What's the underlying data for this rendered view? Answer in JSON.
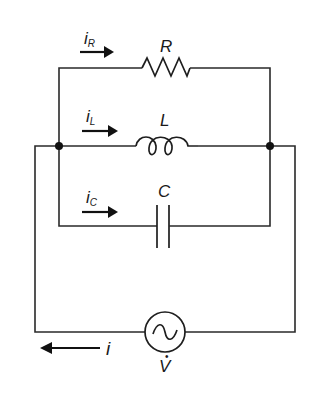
{
  "diagram": {
    "components": {
      "resistor": {
        "label": "R"
      },
      "inductor": {
        "label": "L"
      },
      "capacitor": {
        "label": "C"
      },
      "source": {
        "label": "V",
        "label_mark": "̇",
        "symbol": "~"
      }
    },
    "currents": {
      "i_R": {
        "main": "i",
        "sub": "R",
        "direction": "right"
      },
      "i_L": {
        "main": "i",
        "sub": "L",
        "direction": "right"
      },
      "i_C": {
        "main": "i",
        "sub": "C",
        "direction": "right"
      },
      "i": {
        "main": "i",
        "direction": "left"
      }
    },
    "colors": {
      "line": "#2a2a2a",
      "background": "#ffffff"
    }
  }
}
